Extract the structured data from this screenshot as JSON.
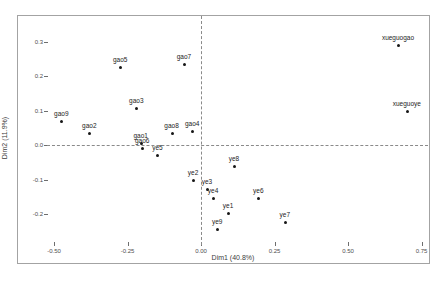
{
  "figure": {
    "xlabel": "Dim1 (40.8%)",
    "ylabel": "Dim2 (11.9%)",
    "x_ticks": [
      "-0.50",
      "-0.25",
      "0.00",
      "0.25",
      "0.50",
      "0.75"
    ],
    "y_ticks": [
      "0.3",
      "0.2",
      "0.1",
      "0.0",
      "-0.1",
      "-0.2"
    ]
  },
  "chart_data": {
    "type": "scatter",
    "title": "",
    "xlabel": "Dim1 (40.8%)",
    "ylabel": "Dim2 (11.9%)",
    "xlim": [
      -0.55,
      0.78
    ],
    "ylim": [
      -0.28,
      0.38
    ],
    "grid": false,
    "legend": "none",
    "reference_lines": [
      {
        "axis": "h",
        "value": 0,
        "style": "dashed"
      },
      {
        "axis": "v",
        "value": 0,
        "style": "dashed"
      }
    ],
    "points": [
      {
        "label": "gao9",
        "x": -0.475,
        "y": 0.07
      },
      {
        "label": "gao2",
        "x": -0.38,
        "y": 0.035
      },
      {
        "label": "gao5",
        "x": -0.275,
        "y": 0.225
      },
      {
        "label": "gao3",
        "x": -0.22,
        "y": 0.107
      },
      {
        "label": "gao1",
        "x": -0.205,
        "y": 0.005
      },
      {
        "label": "gao6",
        "x": -0.2,
        "y": -0.008
      },
      {
        "label": "ye5",
        "x": -0.148,
        "y": -0.028
      },
      {
        "label": "gao8",
        "x": -0.1,
        "y": 0.036
      },
      {
        "label": "gao7",
        "x": -0.058,
        "y": 0.235
      },
      {
        "label": "gao4",
        "x": -0.03,
        "y": 0.042
      },
      {
        "label": "ye2",
        "x": -0.027,
        "y": -0.1
      },
      {
        "label": "ye3",
        "x": 0.02,
        "y": -0.127
      },
      {
        "label": "ye4",
        "x": 0.041,
        "y": -0.153
      },
      {
        "label": "ye9",
        "x": 0.055,
        "y": -0.244
      },
      {
        "label": "ye8",
        "x": 0.112,
        "y": -0.06
      },
      {
        "label": "ye1",
        "x": 0.092,
        "y": -0.197
      },
      {
        "label": "ye6",
        "x": 0.195,
        "y": -0.154
      },
      {
        "label": "ye7",
        "x": 0.285,
        "y": -0.222
      },
      {
        "label": "xueguogao",
        "x": 0.67,
        "y": 0.29
      },
      {
        "label": "xueguoye",
        "x": 0.7,
        "y": 0.1
      }
    ]
  },
  "colors": {
    "background": "#ffffff",
    "border": "#a3a3a3",
    "point": "#161616",
    "point_label": "#242424",
    "tick_text": "#4e4e4e",
    "axis_text": "#3d3d3d",
    "dashed_line": "#8a8a8a"
  }
}
